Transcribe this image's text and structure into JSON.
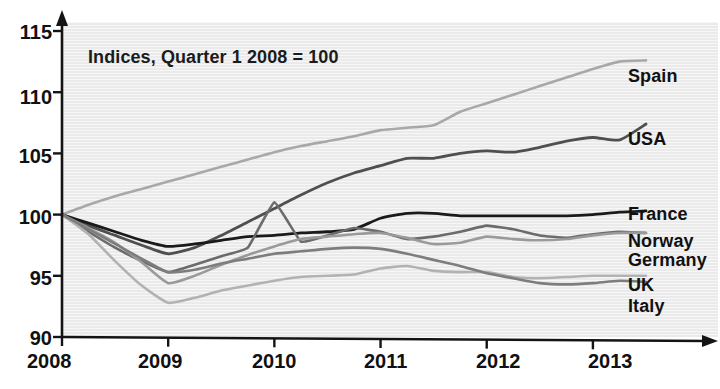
{
  "chart_data": {
    "type": "line",
    "title": "",
    "annotation": "Indices, Quarter 1 2008 = 100",
    "xlabel": "",
    "ylabel": "",
    "xlim": [
      2008,
      2013.75
    ],
    "ylim": [
      90,
      115
    ],
    "grid": false,
    "legend_position": "right-inline-labels",
    "x_ticks": [
      "2008",
      "2009",
      "2010",
      "2011",
      "2012",
      "2013"
    ],
    "x_tick_values": [
      2008,
      2009,
      2010,
      2011,
      2012,
      2013
    ],
    "y_ticks": [
      "90",
      "95",
      "100",
      "105",
      "110",
      "115"
    ],
    "y_tick_values": [
      90,
      95,
      100,
      105,
      110,
      115
    ],
    "x": [
      2008.0,
      2008.25,
      2008.5,
      2008.75,
      2009.0,
      2009.25,
      2009.5,
      2009.75,
      2010.0,
      2010.25,
      2010.5,
      2010.75,
      2011.0,
      2011.25,
      2011.5,
      2011.75,
      2012.0,
      2012.25,
      2012.5,
      2012.75,
      2013.0,
      2013.25,
      2013.5
    ],
    "series": [
      {
        "name": "Spain",
        "color": "#a8a8a8",
        "width": 2.6,
        "label_x": 628,
        "label_y": 66,
        "values": [
          100.0,
          100.8,
          101.5,
          102.1,
          102.7,
          103.3,
          103.9,
          104.5,
          105.1,
          105.6,
          106.0,
          106.4,
          106.9,
          107.1,
          107.3,
          108.4,
          109.1,
          109.8,
          110.5,
          111.2,
          111.9,
          112.5,
          112.6
        ]
      },
      {
        "name": "USA",
        "color": "#4f4f4f",
        "width": 2.8,
        "label_x": 628,
        "label_y": 129,
        "values": [
          100.0,
          99.1,
          98.3,
          97.5,
          96.8,
          97.3,
          98.3,
          99.4,
          100.5,
          101.6,
          102.6,
          103.4,
          104.0,
          104.6,
          104.6,
          105.0,
          105.2,
          105.1,
          105.5,
          106.0,
          106.3,
          106.1,
          107.4
        ]
      },
      {
        "name": "France",
        "color": "#1a1a1a",
        "width": 2.8,
        "label_x": 628,
        "label_y": 204,
        "values": [
          100.0,
          99.3,
          98.6,
          97.9,
          97.4,
          97.6,
          97.9,
          98.2,
          98.3,
          98.5,
          98.6,
          98.8,
          99.7,
          100.1,
          100.1,
          99.9,
          99.9,
          99.9,
          99.9,
          99.9,
          100.0,
          100.2,
          100.3
        ]
      },
      {
        "name": "Norway",
        "color": "#6b6b6b",
        "width": 2.6,
        "label_x": 628,
        "label_y": 231,
        "values": [
          100.0,
          98.6,
          97.3,
          96.2,
          95.3,
          95.9,
          96.6,
          97.3,
          101.0,
          97.8,
          98.3,
          98.9,
          98.6,
          98.0,
          98.2,
          98.6,
          99.1,
          98.8,
          98.3,
          98.1,
          98.4,
          98.6,
          98.5
        ]
      },
      {
        "name": "Germany",
        "color": "#9a9a9a",
        "width": 2.6,
        "label_x": 628,
        "label_y": 250,
        "values": [
          100.0,
          98.9,
          97.7,
          96.1,
          94.4,
          95.0,
          95.9,
          96.7,
          97.4,
          98.0,
          98.2,
          98.4,
          98.5,
          98.1,
          97.6,
          97.7,
          98.2,
          98.0,
          97.9,
          98.0,
          98.3,
          98.5,
          98.5
        ]
      },
      {
        "name": "UK",
        "color": "#b2b2b2",
        "width": 2.6,
        "label_x": 628,
        "label_y": 275,
        "values": [
          100.0,
          98.4,
          96.2,
          94.2,
          92.8,
          93.2,
          93.8,
          94.2,
          94.6,
          94.9,
          95.0,
          95.1,
          95.6,
          95.8,
          95.4,
          95.3,
          95.3,
          94.9,
          94.8,
          94.9,
          95.0,
          95.0,
          95.0
        ]
      },
      {
        "name": "Italy",
        "color": "#7d7d7d",
        "width": 2.6,
        "label_x": 628,
        "label_y": 296,
        "values": [
          100.0,
          98.8,
          97.6,
          96.4,
          95.3,
          95.5,
          96.0,
          96.4,
          96.8,
          97.0,
          97.2,
          97.3,
          97.2,
          96.8,
          96.3,
          95.8,
          95.2,
          94.8,
          94.4,
          94.3,
          94.4,
          94.6,
          94.5
        ]
      }
    ]
  },
  "axes": {
    "y_tick_labels": [
      {
        "text": "115",
        "x": 6,
        "y": 21
      },
      {
        "text": "110",
        "x": 6,
        "y": 86
      },
      {
        "text": "105",
        "x": 6,
        "y": 145
      },
      {
        "text": "100",
        "x": 6,
        "y": 206
      },
      {
        "text": "95",
        "x": 6,
        "y": 267
      },
      {
        "text": "90",
        "x": 6,
        "y": 327
      }
    ],
    "x_tick_labels": [
      {
        "text": "2008",
        "x": 27,
        "y": 350
      },
      {
        "text": "2009",
        "x": 138,
        "y": 350
      },
      {
        "text": "2010",
        "x": 252,
        "y": 350
      },
      {
        "text": "2011",
        "x": 364,
        "y": 350
      },
      {
        "text": "2012",
        "x": 476,
        "y": 350
      },
      {
        "text": "2013",
        "x": 588,
        "y": 350
      }
    ]
  }
}
